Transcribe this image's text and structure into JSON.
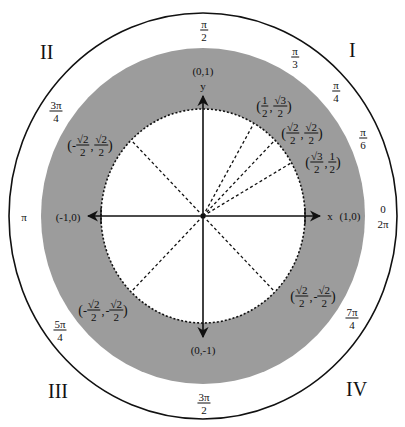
{
  "diagram": {
    "center": {
      "x": 203,
      "y": 216
    },
    "colors": {
      "band": "#9c9c9c",
      "line": "#111111",
      "background": "#ffffff"
    },
    "quadrants": [
      {
        "label": "I",
        "x": 356,
        "y": 50
      },
      {
        "label": "II",
        "x": 50,
        "y": 52
      },
      {
        "label": "III",
        "x": 63,
        "y": 391
      },
      {
        "label": "IV",
        "x": 360,
        "y": 389
      }
    ],
    "axes": {
      "x_label": "x",
      "y_label": "y",
      "points": {
        "right": "(1,0)",
        "left": "(-1,0)",
        "top": "(0,1)",
        "bottom": "(0,-1)"
      }
    },
    "angles": [
      {
        "id": "pi-over-2",
        "num": "π",
        "den": "2",
        "x": 204,
        "y": 30
      },
      {
        "id": "pi-over-3",
        "num": "π",
        "den": "3",
        "x": 295,
        "y": 57
      },
      {
        "id": "pi-over-4",
        "num": "π",
        "den": "4",
        "x": 336,
        "y": 91
      },
      {
        "id": "pi-over-6",
        "num": "π",
        "den": "6",
        "x": 363,
        "y": 138
      },
      {
        "id": "three-pi-over-4",
        "num": "3π",
        "den": "4",
        "x": 56,
        "y": 111
      },
      {
        "id": "five-pi-over-4",
        "num": "5π",
        "den": "4",
        "x": 60,
        "y": 330
      },
      {
        "id": "three-pi-over-2",
        "num": "3π",
        "den": "2",
        "x": 204,
        "y": 403
      },
      {
        "id": "seven-pi-over-4",
        "num": "7π",
        "den": "4",
        "x": 352,
        "y": 318
      }
    ],
    "angle_plain": {
      "pi": "π",
      "zero": "0",
      "two_pi": "2π"
    },
    "coordinates": [
      {
        "id": "coord-60",
        "x_sign": "",
        "x_num": "1",
        "x_den": "2",
        "y_sign": "",
        "y_num": "√3",
        "y_den": "2",
        "px": 274,
        "py": 106
      },
      {
        "id": "coord-45",
        "x_sign": "",
        "x_num": "√2",
        "x_den": "2",
        "y_sign": "",
        "y_num": "√2",
        "y_den": "2",
        "px": 302,
        "py": 133
      },
      {
        "id": "coord-30",
        "x_sign": "",
        "x_num": "√3",
        "x_den": "2",
        "y_sign": "",
        "y_num": "1",
        "y_den": "2",
        "px": 323,
        "py": 162
      },
      {
        "id": "coord-135",
        "x_sign": "-",
        "x_num": "√2",
        "x_den": "2",
        "y_sign": "",
        "y_num": "√2",
        "y_den": "2",
        "px": 90,
        "py": 145
      },
      {
        "id": "coord-225",
        "x_sign": "-",
        "x_num": "√2",
        "x_den": "2",
        "y_sign": "-",
        "y_num": "√2",
        "y_den": "2",
        "px": 103,
        "py": 310
      },
      {
        "id": "coord-315",
        "x_sign": "",
        "x_num": "√2",
        "x_den": "2",
        "y_sign": "-",
        "y_num": "√2",
        "y_den": "2",
        "px": 313,
        "py": 296
      }
    ]
  }
}
